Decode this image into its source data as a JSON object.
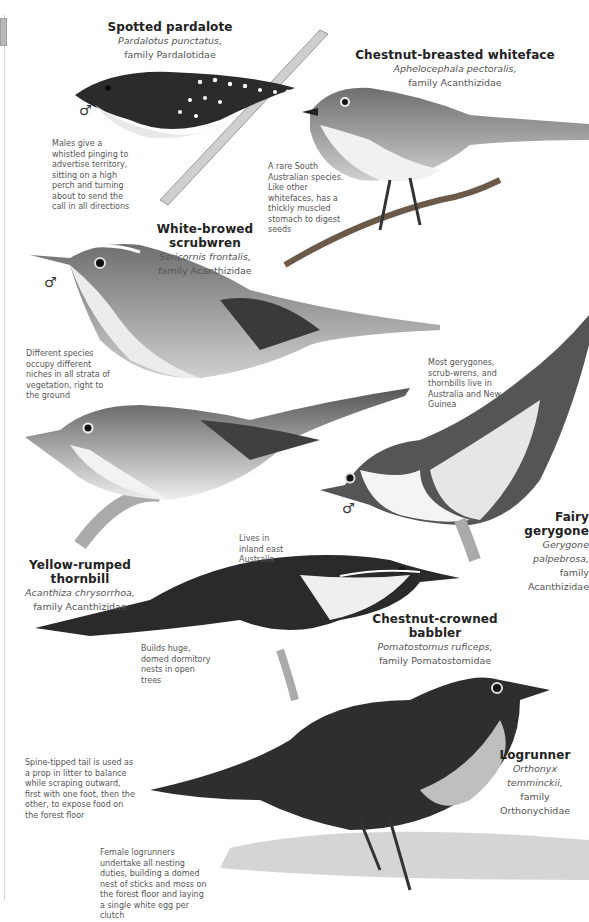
{
  "species": [
    {
      "common_name": "Spotted pardalote",
      "scientific_name": "Pardalotus punctatus,",
      "family": "family Pardalotidae",
      "sex": "♂",
      "note": "Males give a whistled pinging to advertise territory, sitting on a high perch and turning about to send the call in all directions"
    },
    {
      "common_name": "Chestnut-breasted whiteface",
      "scientific_name": "Aphelocephala pectoralis,",
      "family": "family Acanthizidae",
      "note": "A rare South Australian species. Like other whitefaces, has a thickly muscled stomach to digest seeds"
    },
    {
      "common_name": "White-browed scrubwren",
      "scientific_name": "Sericornis frontalis,",
      "family": "family Acanthizidae",
      "sex": "♂",
      "note": "Different species occupy different niches in all strata of vegetation, right to the ground"
    },
    {
      "common_name": "Fairy gerygone",
      "scientific_name": "Gerygone palpebrosa,",
      "family": "family Acanthizidae",
      "sex": "♂",
      "note": "Most gerygones, scrub-wrens, and thornbills live in Australia and New Guinea"
    },
    {
      "common_name": "Yellow-rumped thornbill",
      "scientific_name": "Acanthiza chrysorrhoa,",
      "family": "family Acanthizidae",
      "note": "Lives in inland east Australia"
    },
    {
      "common_name": "Chestnut-crowned babbler",
      "scientific_name": "Pomatostomus ruficeps,",
      "family": "family Pomatostomidae",
      "note": "Builds huge, domed dormitory nests in open trees"
    },
    {
      "common_name": "Logrunner",
      "scientific_name": "Orthonyx temminckii,",
      "family": "family Orthonychidae",
      "sex": "♀",
      "note": "Spine-tipped tail is used as a prop in litter to balance while scraping outward, first with one foot, then the other, to expose food on the forest floor",
      "note2": "Female logrunners undertake all nesting duties, building a domed nest of sticks and moss on the forest floor and laying a single white egg per clutch"
    }
  ],
  "colors": {
    "ink": "#222222",
    "caption": "#555555",
    "bird_dark": "#2b2b2b",
    "bird_mid": "#7a7a7a",
    "bird_light": "#d9d9d9"
  }
}
